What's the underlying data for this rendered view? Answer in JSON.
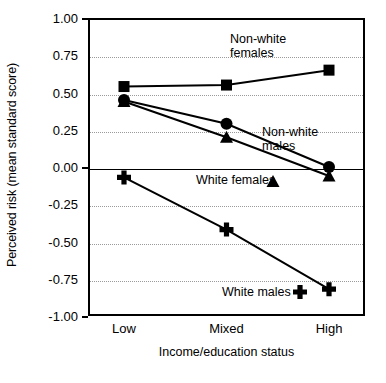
{
  "chart_data": {
    "type": "line",
    "title": "",
    "xlabel": "Income/education status",
    "ylabel": "Perceived risk (mean standard score)",
    "categories": [
      "Low",
      "Mixed",
      "High"
    ],
    "ylim": [
      -1.0,
      1.0
    ],
    "yticks": [
      "1.00",
      "0.75",
      "0.50",
      "0.25",
      "0.00",
      "-0.25",
      "-0.50",
      "-0.75",
      "-1.00"
    ],
    "ytick_values": [
      1.0,
      0.75,
      0.5,
      0.25,
      0.0,
      -0.25,
      -0.5,
      -0.75,
      -1.0
    ],
    "grid": true,
    "legend_position": "inline-annotations",
    "series": [
      {
        "name": "Non-white females",
        "marker": "square",
        "values": [
          0.54,
          0.55,
          0.65
        ]
      },
      {
        "name": "Non-white males",
        "marker": "circle",
        "values": [
          0.45,
          0.29,
          0.0
        ]
      },
      {
        "name": "White females",
        "marker": "triangle",
        "values": [
          0.44,
          0.2,
          -0.06
        ]
      },
      {
        "name": "White males",
        "marker": "plus",
        "values": [
          -0.07,
          -0.42,
          -0.82
        ]
      }
    ],
    "annotations": [
      {
        "text": "Non-white\nfemales",
        "series": "Non-white females"
      },
      {
        "text": "Non-white\nmales",
        "series": "Non-white males"
      },
      {
        "text": "White females",
        "series": "White females"
      },
      {
        "text": "White males",
        "series": "White males"
      }
    ],
    "colors": {
      "line": "#000000",
      "marker": "#000000",
      "grid": "#9a9a9a",
      "axis": "#000000",
      "background": "#ffffff"
    }
  }
}
